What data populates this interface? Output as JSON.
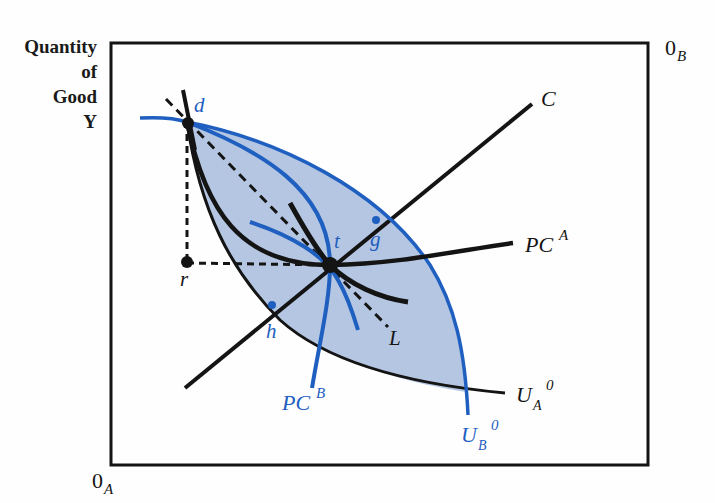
{
  "axis": {
    "y_label_lines": [
      "Quantity",
      "of",
      "Good",
      "Y"
    ],
    "origin_a": "0",
    "origin_a_sub": "A",
    "origin_b": "0",
    "origin_b_sub": "B"
  },
  "points": {
    "d": "d",
    "t": "t",
    "g": "g",
    "h": "h",
    "r": "r"
  },
  "curves": {
    "contract_curve": "C",
    "pc_a": "PC",
    "pc_a_sup": "A",
    "pc_b": "PC",
    "pc_b_sup": "B",
    "budget_line": "L",
    "ua0": "U",
    "ua0_sub": "A",
    "ua0_sup": "0",
    "ub0": "U",
    "ub0_sub": "B",
    "ub0_sup": "0"
  },
  "colors": {
    "blue": "#1f5fc0",
    "fill": "#b4c6e2",
    "black": "#141414"
  }
}
